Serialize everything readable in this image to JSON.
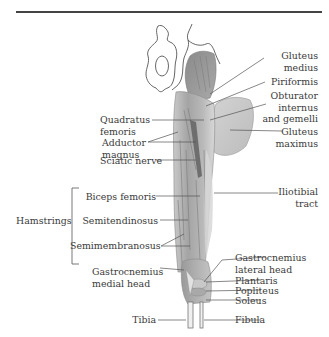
{
  "figure": {
    "colors": {
      "rule": "#444444",
      "text": "#3a3a3a",
      "muscle_dark": "#8f8f8f",
      "muscle_mid": "#b3b3b3",
      "muscle_light": "#d4d4d4",
      "bone_outline": "#555555",
      "leader": "#555555"
    }
  },
  "labels": {
    "right": [
      {
        "id": "gluteus-medius",
        "line1": "Gluteus",
        "line2": "medius"
      },
      {
        "id": "piriformis",
        "line1": "Piriformis"
      },
      {
        "id": "obturator",
        "line1": "Obturator",
        "line2": "internus",
        "line3": "and gemelli"
      },
      {
        "id": "gluteus-maximus",
        "line1": "Gluteus",
        "line2": "maximus"
      },
      {
        "id": "iliotibial",
        "line1": "Iliotibial",
        "line2": "tract"
      },
      {
        "id": "gastrocnemius-lateral",
        "line1": "Gastrocnemius",
        "line2": "lateral head"
      },
      {
        "id": "plantaris",
        "line1": "Plantaris"
      },
      {
        "id": "popliteus",
        "line1": "Popliteus"
      },
      {
        "id": "soleus",
        "line1": "Soleus"
      },
      {
        "id": "fibula",
        "line1": "Fibula"
      }
    ],
    "left": [
      {
        "id": "quadratus-femoris",
        "line1": "Quadratus",
        "line2": "femoris"
      },
      {
        "id": "adductor-magnus",
        "line1": "Adductor",
        "line2": "magnus"
      },
      {
        "id": "sciatic-nerve",
        "line1": "Sciatic nerve"
      },
      {
        "id": "biceps-femoris",
        "line1": "Biceps femoris"
      },
      {
        "id": "semitendinosus",
        "line1": "Semitendinosus"
      },
      {
        "id": "semimembranosus",
        "line1": "Semimembranosus"
      },
      {
        "id": "gastrocnemius-medial",
        "line1": "Gastrocnemius",
        "line2": "medial head"
      },
      {
        "id": "tibia",
        "line1": "Tibia"
      }
    ],
    "group": {
      "id": "hamstrings",
      "label": "Hamstrings"
    }
  }
}
